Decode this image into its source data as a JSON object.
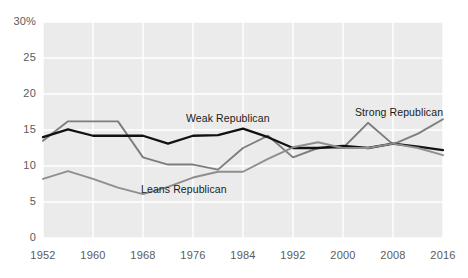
{
  "chart_data": {
    "type": "line",
    "title": "",
    "subtitle": "",
    "xlabel": "",
    "ylabel": "",
    "xlim": [
      1952,
      2016
    ],
    "ylim": [
      0,
      30
    ],
    "yticks": [
      0,
      5,
      10,
      15,
      20,
      25,
      30
    ],
    "ytick_labels": [
      "0",
      "5",
      "10",
      "15",
      "20",
      "25",
      "30%"
    ],
    "xticks": [
      1952,
      1960,
      1968,
      1976,
      1984,
      1992,
      2000,
      2008,
      2016
    ],
    "xtick_labels": [
      "1952",
      "1960",
      "1968",
      "1976",
      "1984",
      "1992",
      "2000",
      "2008",
      "2016"
    ],
    "grid": true,
    "legend": "inline-annotations",
    "plot_background": "#ebebeb",
    "gridline_color": "#ffffff",
    "x": [
      1952,
      1956,
      1960,
      1964,
      1968,
      1972,
      1976,
      1980,
      1984,
      1988,
      1992,
      1996,
      2000,
      2004,
      2008,
      2012,
      2016
    ],
    "series": [
      {
        "name": "Strong Republican",
        "color": "#7d7d7d",
        "values": [
          13.5,
          16.2,
          16.2,
          16.2,
          11.2,
          10.2,
          10.2,
          9.5,
          12.5,
          14.2,
          11.2,
          12.5,
          12.5,
          16.0,
          13.0,
          14.5,
          16.5
        ]
      },
      {
        "name": "Weak Republican",
        "color": "#111111",
        "values": [
          14.0,
          15.1,
          14.2,
          14.2,
          14.2,
          13.1,
          14.2,
          14.3,
          15.2,
          14.0,
          12.5,
          12.5,
          12.8,
          12.5,
          13.1,
          12.7,
          12.2
        ]
      },
      {
        "name": "Leans Republican",
        "color": "#8e8e8e",
        "values": [
          8.2,
          9.3,
          8.2,
          7.0,
          6.1,
          7.1,
          8.4,
          9.2,
          9.2,
          11.0,
          12.6,
          13.3,
          12.5,
          12.5,
          13.1,
          12.5,
          11.5
        ]
      }
    ],
    "annotations": [
      {
        "name": "weak-republican-label",
        "text": "Weak Republican",
        "x_px": 186,
        "y_px": 112
      },
      {
        "name": "leans-republican-label",
        "text": "Leans Republican",
        "x_px": 141,
        "y_px": 183
      },
      {
        "name": "strong-republican-label",
        "text": "Strong Republican",
        "x_px": 355,
        "y_px": 106
      }
    ]
  },
  "axis": {
    "y_labels": [
      "30%",
      "25",
      "20",
      "15",
      "10",
      "5",
      "0"
    ],
    "x_labels": [
      "1952",
      "1960",
      "1968",
      "1976",
      "1984",
      "1992",
      "2000",
      "2008",
      "2016"
    ]
  }
}
